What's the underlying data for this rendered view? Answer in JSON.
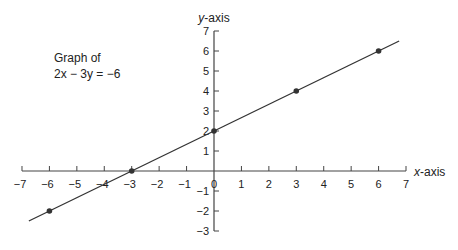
{
  "chart_data": {
    "type": "line",
    "title": "Graph of 2x − 3y = −6",
    "caption_line1": "Graph of",
    "caption_line2": "2x − 3y = −6",
    "xlabel": "x - axis",
    "ylabel": "y - axis",
    "xlim": [
      -7,
      7
    ],
    "ylim": [
      -3,
      7
    ],
    "x_ticks": [
      -7,
      -6,
      -5,
      -4,
      -3,
      -2,
      -1,
      0,
      1,
      2,
      3,
      4,
      5,
      6,
      7
    ],
    "y_ticks": [
      -3,
      -2,
      -1,
      1,
      2,
      3,
      4,
      5,
      6,
      7
    ],
    "grid": false,
    "series": [
      {
        "name": "2x - 3y = -6",
        "equation": "y = (2/3)x + 2",
        "points": [
          {
            "x": -6,
            "y": -2
          },
          {
            "x": -3,
            "y": 0
          },
          {
            "x": 0,
            "y": 2
          },
          {
            "x": 3,
            "y": 4
          },
          {
            "x": 6,
            "y": 6
          }
        ],
        "line_extent_x": [
          -6.75,
          6.75
        ]
      }
    ],
    "colors": {
      "line": "#333333",
      "points": "#333333",
      "axes": "#444444"
    }
  }
}
